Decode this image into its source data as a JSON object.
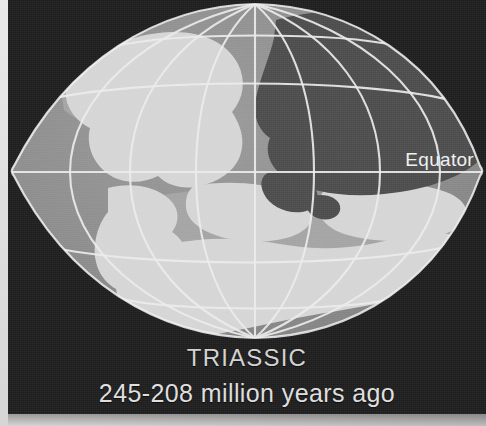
{
  "figure": {
    "kind": "paleogeographic-globe-illustration",
    "projection": "oval-graticule",
    "caption": {
      "period_name": "TRIASSIC",
      "time_range": "245-208 million years ago"
    },
    "map_labels": {
      "equator": "Equator"
    },
    "colors": {
      "plate_background": "#1d1d1d",
      "mat_background": "#d8d8d8",
      "ocean": "#8e8e8e",
      "shelf": "#a3a3a3",
      "land_light": "#d6d6d6",
      "land_dark": "#4b4b4b",
      "graticule": "#eaeaea",
      "caption_text": "#d9d9d9",
      "label_text": "#f0f0f0"
    },
    "legend_tones": [
      {
        "name": "ocean",
        "swatch": "#8e8e8e",
        "meaning": "ocean"
      },
      {
        "name": "land-light",
        "swatch": "#d6d6d6",
        "meaning": "emergent land"
      },
      {
        "name": "land-dark",
        "swatch": "#4b4b4b",
        "meaning": "shaded landmass"
      },
      {
        "name": "shelf",
        "swatch": "#a3a3a3",
        "meaning": "continental shelf"
      }
    ],
    "graticule": {
      "meridian_count": 7,
      "parallel_count": 5,
      "equator_y": 173,
      "north_pole": {
        "x": 255,
        "y": 8
      },
      "south_pole": {
        "x": 255,
        "y": 335
      }
    }
  }
}
